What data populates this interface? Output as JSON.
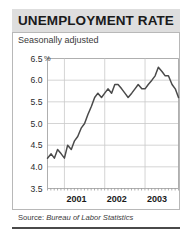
{
  "figure": {
    "title": "UNEMPLOYMENT RATE",
    "subtitle": "Seasonally adjusted",
    "source_label": "Source:",
    "source_name": "Bureau of Labor Statistics",
    "percent_symbol": "%",
    "colors": {
      "title_band": "#dedede",
      "panel_border": "#b8b8b8",
      "grid": "#c9c9c9",
      "line": "#4a4a4a",
      "bottom_rule": "#4a4a4a",
      "background": "#ffffff",
      "text": "#1a1a1a"
    }
  },
  "chart_data": {
    "type": "line",
    "title": "UNEMPLOYMENT RATE",
    "subtitle": "Seasonally adjusted",
    "xlabel": "",
    "ylabel": "",
    "unit": "%",
    "grid": true,
    "legend": "none",
    "ylim": [
      3.5,
      6.5
    ],
    "yticks": [
      3.5,
      4.0,
      4.5,
      5.0,
      5.5,
      6.0,
      6.5
    ],
    "ytick_labels": [
      "3.5",
      "4.0",
      "4.5",
      "5.0",
      "5.5",
      "6.0",
      "6.5"
    ],
    "xlim": [
      2000.58,
      2003.83
    ],
    "xticks": [
      2001.0,
      2002.0,
      2003.0
    ],
    "xtick_labels": [
      "2001",
      "2002",
      "2003"
    ],
    "series": [
      {
        "name": "Unemployment rate",
        "color": "#4a4a4a",
        "x": [
          2000.58,
          2000.67,
          2000.75,
          2000.83,
          2000.92,
          2001.0,
          2001.08,
          2001.17,
          2001.25,
          2001.33,
          2001.42,
          2001.5,
          2001.58,
          2001.67,
          2001.75,
          2001.83,
          2001.92,
          2002.0,
          2002.08,
          2002.17,
          2002.25,
          2002.33,
          2002.42,
          2002.5,
          2002.58,
          2002.67,
          2002.75,
          2002.83,
          2002.92,
          2003.0,
          2003.08,
          2003.17,
          2003.25,
          2003.33,
          2003.42,
          2003.5,
          2003.58,
          2003.67,
          2003.75,
          2003.83
        ],
        "y": [
          4.2,
          4.3,
          4.2,
          4.4,
          4.3,
          4.2,
          4.5,
          4.4,
          4.6,
          4.7,
          4.9,
          5.0,
          5.2,
          5.4,
          5.6,
          5.7,
          5.6,
          5.7,
          5.8,
          5.7,
          5.9,
          5.9,
          5.8,
          5.7,
          5.6,
          5.7,
          5.8,
          5.9,
          5.8,
          5.8,
          5.9,
          6.0,
          6.1,
          6.3,
          6.2,
          6.1,
          6.1,
          5.9,
          5.8,
          5.6
        ]
      }
    ],
    "annotations": []
  }
}
